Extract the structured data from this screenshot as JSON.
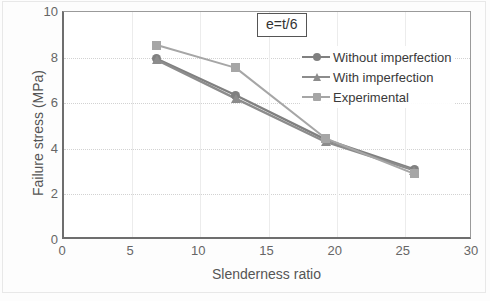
{
  "chart_data": {
    "type": "line",
    "title": "",
    "subtitle": "",
    "xlabel": "Slenderness ratio",
    "ylabel": "Failure stress (MPa)",
    "xlim": [
      0,
      30
    ],
    "ylim": [
      0,
      10
    ],
    "xticks": [
      0,
      5,
      10,
      15,
      20,
      25,
      30
    ],
    "yticks": [
      0,
      2,
      4,
      6,
      8,
      10
    ],
    "grid": true,
    "legend_position": "upper right inside",
    "annotations": [
      {
        "text": "e=t/6",
        "position": "top center",
        "boxed": true
      }
    ],
    "x": [
      6.8,
      12.6,
      19.2,
      25.7
    ],
    "series": [
      {
        "name": "Without imperfection",
        "marker": "circle",
        "color": "#808080",
        "values": [
          7.95,
          6.35,
          4.4,
          3.1
        ]
      },
      {
        "name": "With imperfection",
        "marker": "triangle",
        "color": "#8c8c8c",
        "values": [
          7.9,
          6.2,
          4.3,
          3.05
        ]
      },
      {
        "name": "Experimental",
        "marker": "square",
        "color": "#a6a6a6",
        "values": [
          8.55,
          7.55,
          4.45,
          2.9
        ]
      }
    ]
  },
  "axis": {
    "y_title": "Failure stress (MPa)",
    "x_title": "Slenderness ratio",
    "y_tick_labels": [
      "10",
      "8",
      "6",
      "4",
      "2",
      "0"
    ],
    "x_tick_labels": [
      "0",
      "5",
      "10",
      "15",
      "20",
      "25",
      "30"
    ]
  },
  "annotation": {
    "label": "e=t/6"
  },
  "legend": {
    "items": [
      {
        "label": "Without imperfection",
        "marker": "circle-marker-icon",
        "color": "#808080"
      },
      {
        "label": "With imperfection",
        "marker": "triangle-marker-icon",
        "color": "#8c8c8c"
      },
      {
        "label": "Experimental",
        "marker": "square-marker-icon",
        "color": "#a6a6a6"
      }
    ]
  }
}
